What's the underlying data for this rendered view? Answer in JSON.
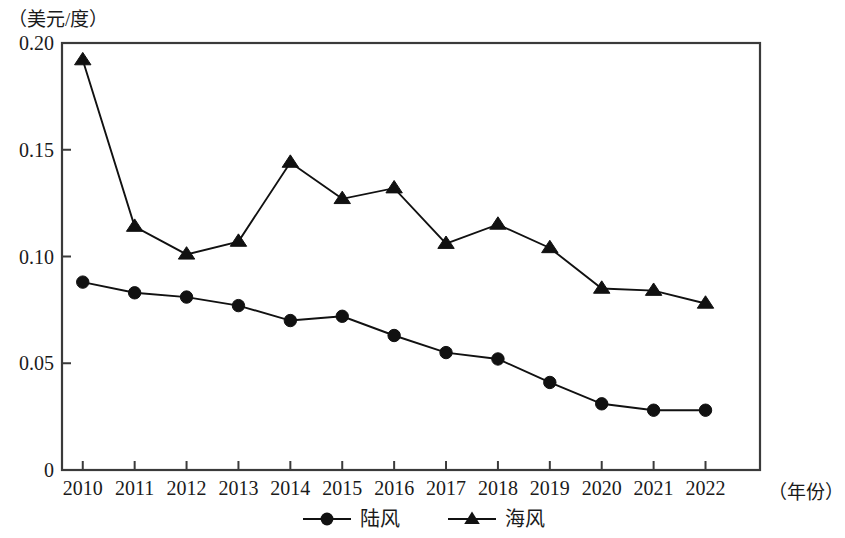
{
  "chart_data": {
    "type": "line",
    "title": "",
    "subtitle": "",
    "ylabel": "（美元/度）",
    "xlabel": "（年份）",
    "categories": [
      "2010",
      "2011",
      "2012",
      "2013",
      "2014",
      "2015",
      "2016",
      "2017",
      "2018",
      "2019",
      "2020",
      "2021",
      "2022"
    ],
    "x": [
      2010,
      2011,
      2012,
      2013,
      2014,
      2015,
      2016,
      2017,
      2018,
      2019,
      2020,
      2021,
      2022
    ],
    "ylim": [
      0,
      0.2
    ],
    "yticks": [
      "0",
      "0.05",
      "0.10",
      "0.15",
      "0.20"
    ],
    "ytick_values": [
      0,
      0.05,
      0.1,
      0.15,
      0.2
    ],
    "grid": false,
    "legend_position": "bottom-center",
    "series": [
      {
        "name": "陆风",
        "marker": "circle",
        "color": "#111111",
        "values": [
          0.088,
          0.083,
          0.081,
          0.077,
          0.07,
          0.072,
          0.063,
          0.055,
          0.052,
          0.041,
          0.031,
          0.028,
          0.028
        ]
      },
      {
        "name": "海风",
        "marker": "triangle",
        "color": "#111111",
        "values": [
          0.192,
          0.114,
          0.101,
          0.107,
          0.144,
          0.127,
          0.132,
          0.106,
          0.115,
          0.104,
          0.085,
          0.084,
          0.078
        ]
      }
    ]
  },
  "legend": {
    "items": [
      {
        "label": "陆风",
        "marker": "circle"
      },
      {
        "label": "海风",
        "marker": "triangle"
      }
    ]
  },
  "axes": {
    "y_unit_label": "（美元/度）",
    "x_unit_label": "（年份）"
  }
}
